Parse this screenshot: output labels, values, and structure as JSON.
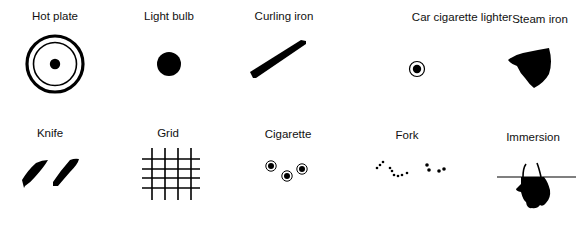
{
  "figure": {
    "colors": {
      "ink": "#000000",
      "background": "#ffffff"
    },
    "items": [
      {
        "label": "Hot plate",
        "icon": "hot-plate-icon",
        "row": 1,
        "col": 1
      },
      {
        "label": "Light bulb",
        "icon": "light-bulb-icon",
        "row": 1,
        "col": 2
      },
      {
        "label": "Curling iron",
        "icon": "curling-iron-icon",
        "row": 1,
        "col": 3
      },
      {
        "label": "Car cigarette lighter",
        "icon": "car-cigarette-lighter-icon",
        "row": 1,
        "col": 4
      },
      {
        "label": "Steam iron",
        "icon": "steam-iron-icon",
        "row": 1,
        "col": 5
      },
      {
        "label": "Knife",
        "icon": "knife-icon",
        "row": 2,
        "col": 1
      },
      {
        "label": "Grid",
        "icon": "grid-icon",
        "row": 2,
        "col": 2
      },
      {
        "label": "Cigarette",
        "icon": "cigarette-icon",
        "row": 2,
        "col": 3
      },
      {
        "label": "Fork",
        "icon": "fork-icon",
        "row": 2,
        "col": 4
      },
      {
        "label": "Immersion",
        "icon": "immersion-icon",
        "row": 2,
        "col": 5
      }
    ]
  }
}
